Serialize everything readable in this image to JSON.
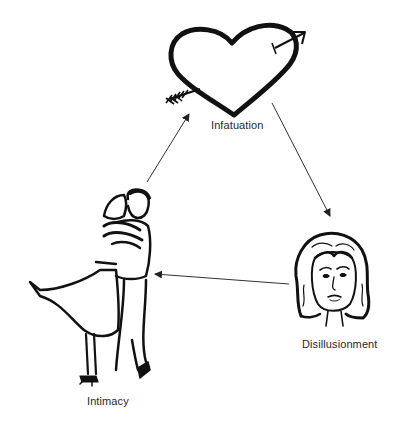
{
  "diagram": {
    "type": "cycle",
    "nodes": [
      {
        "id": "infatuation",
        "label": "Infatuation",
        "icon": "heart-with-arrow-icon"
      },
      {
        "id": "disillusionment",
        "label": "Disillusionment",
        "icon": "woman-face-icon"
      },
      {
        "id": "intimacy",
        "label": "Intimacy",
        "icon": "embracing-couple-icon"
      }
    ],
    "edges": [
      {
        "from": "infatuation",
        "to": "disillusionment"
      },
      {
        "from": "disillusionment",
        "to": "intimacy"
      },
      {
        "from": "intimacy",
        "to": "infatuation"
      }
    ]
  },
  "colors": {
    "ink": "#111111",
    "arrow": "#333333",
    "label": "#2a2a2a",
    "background": "#ffffff"
  }
}
